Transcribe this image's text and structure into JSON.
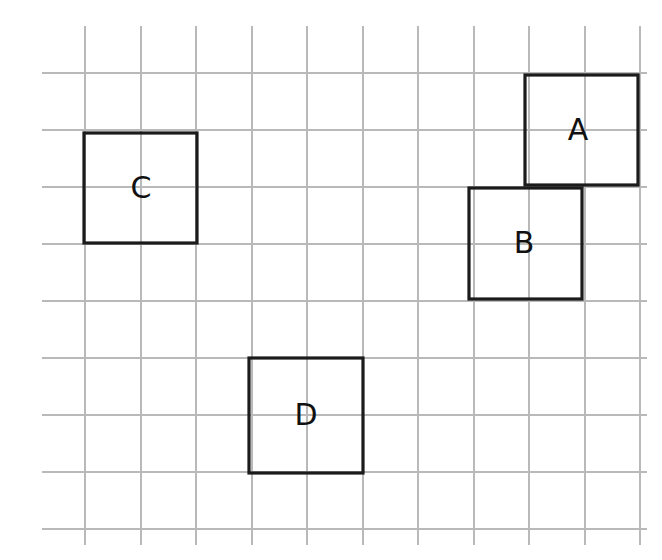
{
  "figure": {
    "background_color": "#ffffff",
    "width": 662,
    "height": 560
  },
  "grid": {
    "line_color": "#b9b9b9",
    "line_width": 1.1,
    "vertical_x": [
      85,
      141,
      196,
      252,
      307,
      363,
      418,
      474,
      529,
      585,
      640
    ],
    "vertical_y_start": 26,
    "vertical_y_end": 545,
    "horizontal_y": [
      73,
      130,
      187,
      244,
      301,
      358,
      415,
      472,
      529
    ],
    "horizontal_x_start": 42,
    "horizontal_x_end": 647,
    "cell_width": 55.5,
    "cell_height": 57
  },
  "squares": {
    "stroke_color": "#1b1b1b",
    "stroke_width": 3.2,
    "fill": "none",
    "items": [
      {
        "id": "square-a",
        "label": "A",
        "x": 525,
        "y": 75,
        "width": 113,
        "height": 110,
        "label_x": 578,
        "label_y": 131
      },
      {
        "id": "square-b",
        "label": "B",
        "x": 469,
        "y": 188,
        "width": 113,
        "height": 111,
        "label_x": 524,
        "label_y": 244
      },
      {
        "id": "square-c",
        "label": "C",
        "x": 84,
        "y": 133,
        "width": 113,
        "height": 110,
        "label_x": 141,
        "label_y": 189
      },
      {
        "id": "square-d",
        "label": "D",
        "x": 249,
        "y": 358,
        "width": 114,
        "height": 115,
        "label_x": 306,
        "label_y": 416
      }
    ]
  }
}
